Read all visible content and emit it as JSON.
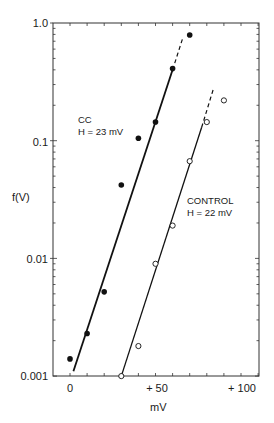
{
  "chart_data": {
    "type": "scatter",
    "title": "",
    "xlabel": "mV",
    "ylabel": "f(V)",
    "yscale": "log",
    "xlim": [
      -10,
      112
    ],
    "ylim": [
      0.001,
      1.0
    ],
    "x_tick_labels": [
      "0",
      "+50",
      "+100"
    ],
    "x_ticks": [
      0,
      50,
      100
    ],
    "y_tick_labels": [
      "1.0",
      "0.1",
      "0.01",
      "0.001"
    ],
    "y_ticks": [
      1.0,
      0.1,
      0.01,
      0.001
    ],
    "grid": false,
    "series": [
      {
        "name": "CC",
        "annotation": "H = 23 mV",
        "marker": "filled-circle",
        "x": [
          0,
          10,
          20,
          30,
          40,
          50,
          60,
          70
        ],
        "y": [
          0.0014,
          0.0023,
          0.0052,
          0.042,
          0.105,
          0.144,
          0.41,
          0.79
        ],
        "fit_line": {
          "solid": [
            [
              2,
              0.0011
            ],
            [
              60,
              0.4
            ]
          ],
          "dashed": [
            [
              60,
              0.4
            ],
            [
              66,
              0.75
            ]
          ]
        }
      },
      {
        "name": "CONTROL",
        "annotation": "H = 22 mV",
        "marker": "open-circle",
        "x": [
          30,
          40,
          50,
          60,
          70,
          80,
          90
        ],
        "y": [
          0.001,
          0.0018,
          0.009,
          0.019,
          0.067,
          0.144,
          0.22
        ],
        "fit_line": {
          "solid": [
            [
              30,
              0.001
            ],
            [
              77,
              0.13
            ]
          ],
          "dashed": [
            [
              77,
              0.13
            ],
            [
              84,
              0.28
            ]
          ]
        }
      }
    ]
  },
  "labels": {
    "y_1": "1.0",
    "y_01": "0.1",
    "y_001": "0.01",
    "y_0001": "0.001",
    "x_0": "0",
    "x_50": "+ 50",
    "x_100": "+ 100",
    "xlabel": "mV",
    "ylabel": "f(V)",
    "cc_name": "CC",
    "cc_h": "H = 23  mV",
    "control_name": "CONTROL",
    "control_h": "H = 22  mV"
  }
}
